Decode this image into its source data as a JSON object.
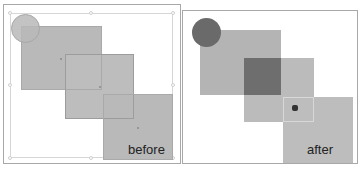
{
  "panels": {
    "before": {
      "label": "before",
      "colors": {
        "square": "#b9b9b9",
        "circle": "#c2c2c2",
        "outline": "#9c9c9c"
      }
    },
    "after": {
      "label": "after",
      "colors": {
        "square": "#b4b4b4",
        "overlap": "#6e6e6e",
        "circle": "#6a6a6a"
      }
    }
  }
}
